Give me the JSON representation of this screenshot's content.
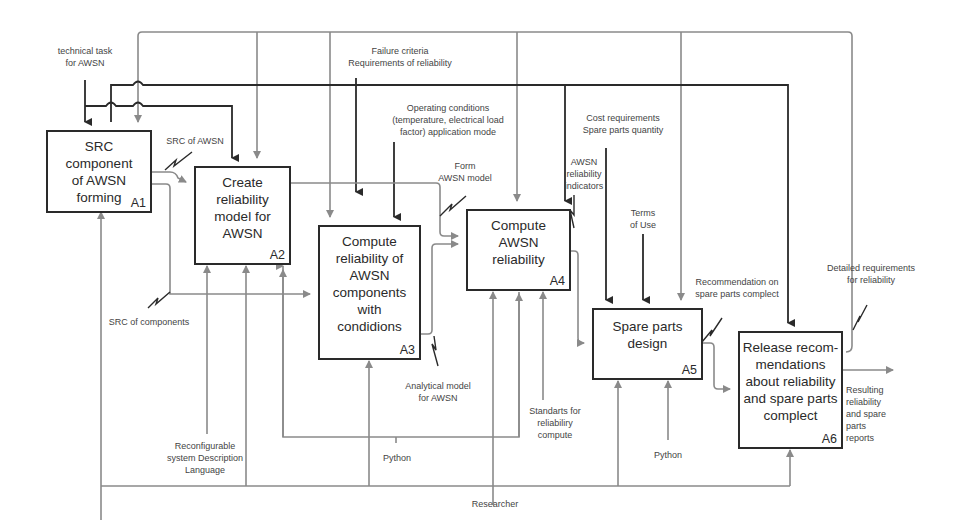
{
  "colors": {
    "control_line": "#2a2a2a",
    "flow_line": "#8a8a8a",
    "box_border": "#2a2a2a",
    "text": "#444444",
    "background": "#ffffff"
  },
  "boxes": [
    {
      "id": "A1",
      "title": "SRC component\nof AWSN\nforming"
    },
    {
      "id": "A2",
      "title": "Create\nreliability\nmodel for\nAWSN"
    },
    {
      "id": "A3",
      "title": "Compute\nreliability of\nAWSN\ncomponents\nwith\ncondidions"
    },
    {
      "id": "A4",
      "title": "Compute\nAWSN\nreliability"
    },
    {
      "id": "A5",
      "title": "Spare parts\ndesign"
    },
    {
      "id": "A6",
      "title": "Release recom-\nmendations\nabout reliability\nand spare parts\ncomplect"
    }
  ],
  "labels": {
    "technical_task": "technical task\nfor AWSN",
    "failure_criteria": "Failure criteria\nRequirements of reliability",
    "operating_conditions": "Operating conditions\n(temperature, electrical load\nfactor) application mode",
    "cost_requirements": "Cost requirements\nSpare parts quantity",
    "src_of_awsn": "SRC of AWSN",
    "form_awsn_model": "Form\nAWSN model",
    "awsn_reliability_indicators": "AWSN\nreliability\nindicators",
    "terms_of_use": "Terms\nof Use",
    "recommendation_spare_parts": "Recommendation on\nspare parts complect",
    "detailed_requirements": "Detailed requirements\nfor reliability",
    "src_of_components": "SRC of components",
    "analytical_model": "Analytical model\nfor AWSN",
    "standards": "Standarts for\nreliabiliry\ncompute",
    "resulting_reports": "Resulting\nreliability\nand spare\nparts\nreports",
    "reconfigurable_language": "Reconfigurable\nsystem Description\nLanguage",
    "python_1": "Python",
    "python_2": "Python",
    "researcher": "Researcher"
  }
}
